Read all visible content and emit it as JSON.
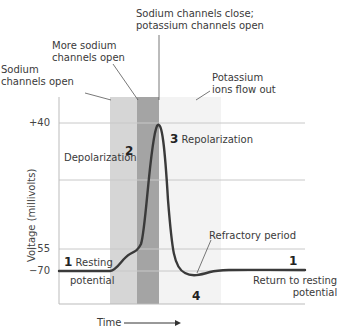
{
  "annotations": {
    "sodium_open": [
      "Sodium",
      "channels open"
    ],
    "more_sodium_open": [
      "More sodium",
      "channels open"
    ],
    "sodium_close": [
      "Sodium channels close;",
      "potassium channels open"
    ],
    "potassium_out": [
      "Potassium",
      "ions flow out"
    ],
    "refractory": "Refractory period",
    "return": [
      "Return to resting",
      "potential"
    ]
  },
  "phases": {
    "p1_num": "1",
    "p1_label": [
      "Resting",
      "potential"
    ],
    "p2_num": "2",
    "p2_label": "Depolarization",
    "p3_num": "3",
    "p3_label": "Repolarization",
    "p4_num": "4",
    "p1b_num": "1"
  },
  "axes": {
    "y_label": "Voltage (millivolts)",
    "x_label": "Time",
    "ticks": [
      "+40",
      "−55",
      "−70"
    ]
  },
  "colors": {
    "band_light": "#d6d6d6",
    "band_dark": "#a4a4a4",
    "band_faint": "#f2f2f2",
    "curve": "#3a3a3a",
    "grid": "#c8c8c8"
  }
}
